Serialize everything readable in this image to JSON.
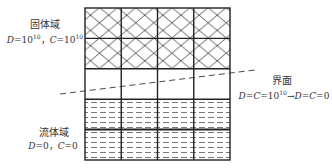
{
  "solid_domain": {
    "title": "固体域",
    "eq_prefix": "D=10",
    "exp": "10",
    "sep": "，",
    "eq2_prefix": "C=10",
    "exp2": "10"
  },
  "interface": {
    "title": "界面",
    "eq_left": "D=C=10",
    "exp": "10",
    "arrow": "→",
    "eq_right": "D=C=0"
  },
  "fluid_domain": {
    "title": "流体域",
    "eq": "D=0，C=0"
  },
  "grid": {
    "columns": 4,
    "rows": 5,
    "solid_rows": 2,
    "empty_rows": 1,
    "fluid_rows": 2
  }
}
